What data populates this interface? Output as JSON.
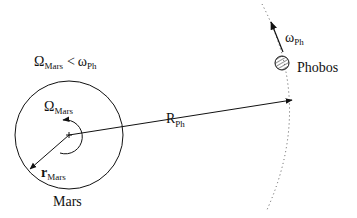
{
  "diagram": {
    "condition": {
      "lhs_symbol": "Ω",
      "lhs_sub": "Mars",
      "operator": "<",
      "rhs_symbol": "ω",
      "rhs_sub": "Ph"
    },
    "mars": {
      "label": "Mars",
      "rotation_symbol": "Ω",
      "rotation_sub": "Mars",
      "radius_symbol": "r",
      "radius_sub": "Mars"
    },
    "orbit_radius": {
      "symbol": "R",
      "sub": "Ph"
    },
    "phobos": {
      "label": "Phobos",
      "velocity_symbol": "ω",
      "velocity_sub": "Ph"
    },
    "colors": {
      "ink": "#111111",
      "orbit": "#555555",
      "background": "#ffffff"
    }
  }
}
